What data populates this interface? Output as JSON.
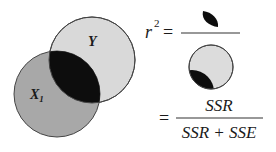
{
  "venn": {
    "circle_y": {
      "label": "Y",
      "fill": "#d9d9d9"
    },
    "circle_x1": {
      "label": "X",
      "subscript": "1",
      "fill": "#a8a8a8"
    },
    "overlap_fill": "#0d0d0d",
    "stroke": "#444444"
  },
  "formula": {
    "lhs_var": "r",
    "lhs_exp": "2",
    "equals": "=",
    "second_equals": "=",
    "numerator": "SSR",
    "denominator": "SSR + SSE"
  }
}
